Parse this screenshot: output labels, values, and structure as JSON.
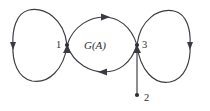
{
  "figure": {
    "type": "directed-multigraph",
    "background_color": "#ffffff",
    "stroke_color": "#3b3b42",
    "label_color": "#2b2b30",
    "center_label": "G(A)",
    "nodes": [
      {
        "id": "1",
        "label": "1",
        "x": 67,
        "y": 45
      },
      {
        "id": "3",
        "label": "3",
        "x": 137,
        "y": 45
      },
      {
        "id": "2",
        "label": "2",
        "x": 137,
        "y": 95
      }
    ],
    "edges": [
      {
        "from": "1",
        "to": "1",
        "shape": "left-loop-upper",
        "arrow": "down-at-left"
      },
      {
        "from": "1",
        "to": "1",
        "shape": "left-loop-lower",
        "arrow": "up-at-left"
      },
      {
        "from": "1",
        "to": "3",
        "shape": "upper-arc",
        "arrow": "right-at-top"
      },
      {
        "from": "3",
        "to": "1",
        "shape": "lower-arc",
        "arrow": "left-at-bottom"
      },
      {
        "from": "3",
        "to": "3",
        "shape": "right-loop-upper",
        "arrow": "down-at-right"
      },
      {
        "from": "3",
        "to": "3",
        "shape": "right-loop-lower",
        "arrow": "up-at-right"
      },
      {
        "from": "2",
        "to": "3",
        "shape": "vertical-line",
        "arrow": "up-at-node-3"
      }
    ]
  }
}
